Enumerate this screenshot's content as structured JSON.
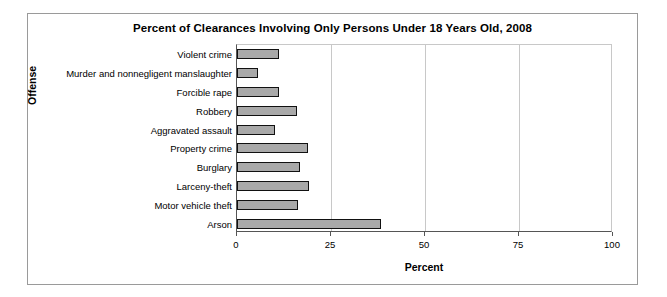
{
  "chart_data": {
    "type": "bar",
    "orientation": "horizontal",
    "title": "Percent of Clearances Involving Only Persons Under 18 Years Old, 2008",
    "xlabel": "Percent",
    "ylabel": "Offense",
    "xlim": [
      0,
      100
    ],
    "xticks": [
      "0",
      "25",
      "50",
      "75",
      "100"
    ],
    "xtick_values": [
      0,
      25,
      50,
      75,
      100
    ],
    "grid": "vertical",
    "legend": "none",
    "bar_color": "#a9a9a9",
    "bar_border_color": "#111111",
    "categories": [
      "Violent crime",
      "Murder and nonnegligent manslaughter",
      "Forcible rape",
      "Robbery",
      "Aggravated assault",
      "Property crime",
      "Burglary",
      "Larceny-theft",
      "Motor vehicle theft",
      "Arson"
    ],
    "values": [
      11.1,
      5.5,
      11.2,
      16.0,
      10.1,
      19.0,
      16.7,
      19.2,
      16.1,
      38.4
    ]
  }
}
